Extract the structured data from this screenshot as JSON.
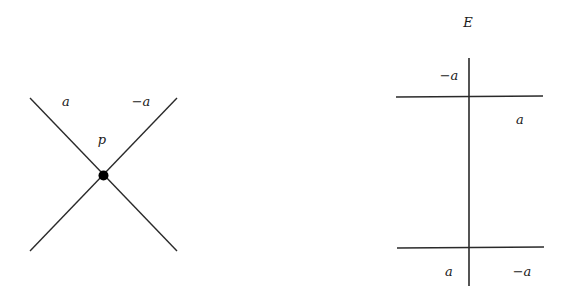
{
  "left_diagram": {
    "point_label": "p",
    "region_labels": {
      "top_left": "a",
      "top_right": "−a"
    },
    "line_color": "#2a2a2a",
    "point_color": "#000000"
  },
  "right_diagram": {
    "title": "E",
    "region_labels": {
      "top_upper_left": "−a",
      "top_lower_right": "a",
      "bottom_lower_left": "a",
      "bottom_lower_right": "−a"
    },
    "line_color": "#2a2a2a"
  }
}
